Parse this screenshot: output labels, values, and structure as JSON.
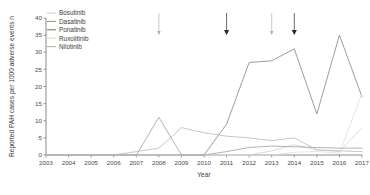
{
  "chart_data": {
    "type": "line",
    "title": "",
    "xlabel": "Year",
    "ylabel": "Reported PAH cases per 1000 adverse events n",
    "x": [
      2003,
      2004,
      2005,
      2006,
      2007,
      2008,
      2009,
      2010,
      2011,
      2012,
      2013,
      2014,
      2015,
      2016,
      2017
    ],
    "xlim": [
      2003,
      2017
    ],
    "ylim": [
      0,
      40
    ],
    "yticks": [
      0,
      5,
      10,
      15,
      20,
      25,
      30,
      35,
      40
    ],
    "xticks": [
      "2003",
      "2004",
      "2005",
      "2006",
      "2007",
      "2008",
      "2009",
      "2010",
      "2011",
      "2012",
      "2013",
      "2014",
      "2015",
      "2016",
      "2017"
    ],
    "grid": false,
    "legend_position": "top-left",
    "series": [
      {
        "name": "Bosutinib",
        "color": "#cfcfcf",
        "values": [
          0,
          0,
          0,
          0,
          0,
          0,
          0,
          0,
          0,
          0,
          1.2,
          3.0,
          1.5,
          1.0,
          8.0
        ]
      },
      {
        "name": "Dasatinib",
        "color": "#9a9a9a",
        "values": [
          0,
          0,
          0,
          0,
          0,
          11.0,
          0,
          0,
          1.0,
          2.2,
          2.6,
          2.4,
          2.2,
          2.0,
          2.0
        ]
      },
      {
        "name": "Ponatinib",
        "color": "#7b7b7b",
        "values": [
          0,
          0,
          0,
          0,
          0,
          0,
          0,
          0,
          9.0,
          27.0,
          27.5,
          31.0,
          12.0,
          35.0,
          17.0
        ]
      },
      {
        "name": "Ruxolitinib",
        "color": "#dcdcdc",
        "values": [
          0,
          0,
          0,
          0,
          0,
          0,
          0,
          0,
          0,
          0,
          0,
          0.8,
          1.0,
          0.5,
          18.0
        ]
      },
      {
        "name": "Nilotinib",
        "color": "#b4b4b4",
        "values": [
          0,
          0,
          0,
          0,
          1.0,
          2.0,
          8.0,
          6.5,
          5.5,
          5.0,
          4.2,
          5.0,
          1.5,
          1.2,
          1.0
        ]
      }
    ],
    "annotations": [
      {
        "name": "approval-arrow-2008",
        "x": 2008,
        "label": "",
        "weight": "light"
      },
      {
        "name": "approval-arrow-2011",
        "x": 2011,
        "label": "",
        "weight": "bold"
      },
      {
        "name": "approval-arrow-2013",
        "x": 2013,
        "label": "",
        "weight": "light"
      },
      {
        "name": "approval-arrow-2014",
        "x": 2014,
        "label": "",
        "weight": "bold"
      }
    ]
  }
}
